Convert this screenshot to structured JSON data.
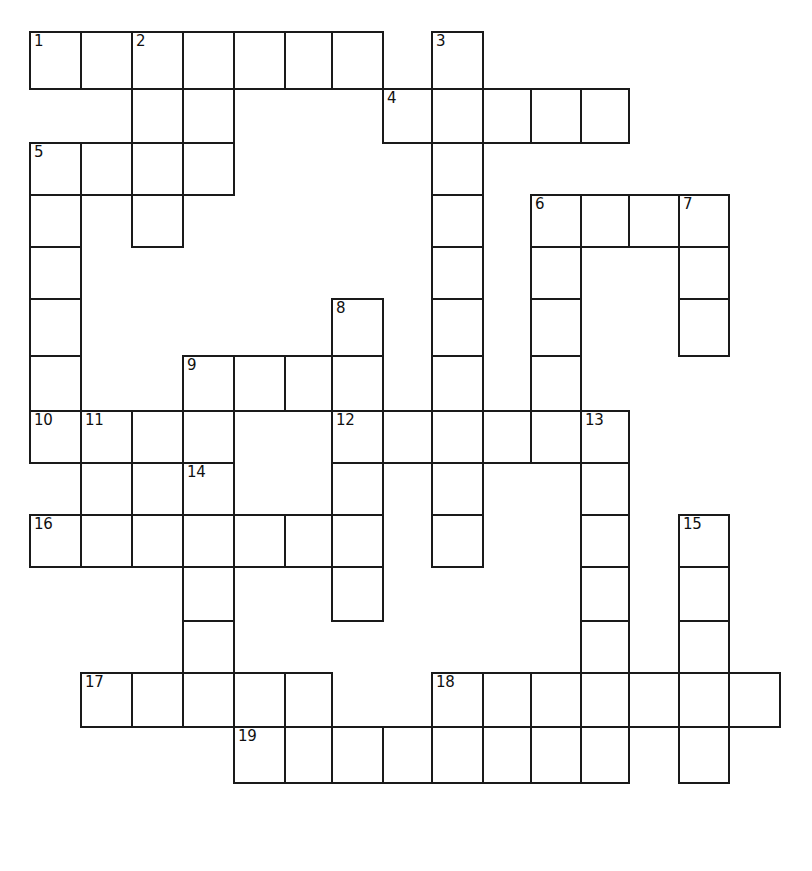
{
  "puzzle": {
    "kind": "crossword-grid",
    "title": "Crossword Puzzle Grid",
    "background_color": "#ffffff",
    "line_color": "#1a1a1a",
    "cell_size": 51,
    "grid_origin": {
      "x": 29,
      "y": 31
    },
    "column_x": [
      29,
      80,
      131,
      182,
      233,
      284,
      331,
      382,
      431,
      482,
      530,
      580,
      628,
      678,
      728
    ],
    "row_y": [
      31,
      88,
      142,
      194,
      246,
      298,
      355,
      410,
      462,
      514,
      566,
      620,
      672,
      726,
      782
    ],
    "numbers_visible": [
      "1",
      "2",
      "3",
      "4",
      "5",
      "6",
      "7",
      "8",
      "9",
      "10",
      "11",
      "12",
      "13",
      "14",
      "15",
      "16",
      "17",
      "18",
      "19"
    ],
    "entries": [
      {
        "number": "1",
        "direction": "across",
        "length": 7,
        "col": 0,
        "row": 0
      },
      {
        "number": "2",
        "direction": "down",
        "length": 4,
        "col": 2,
        "row": 0
      },
      {
        "number": "3",
        "direction": "down",
        "length": 10,
        "col": 8,
        "row": 0
      },
      {
        "number": "4",
        "direction": "across",
        "length": 5,
        "col": 7,
        "row": 1
      },
      {
        "number": "5",
        "direction": "across",
        "length": 4,
        "col": 0,
        "row": 2
      },
      {
        "number": "5",
        "direction": "down",
        "length": 6,
        "col": 0,
        "row": 2
      },
      {
        "number": "6",
        "direction": "across",
        "length": 4,
        "col": 10,
        "row": 3
      },
      {
        "number": "6",
        "direction": "down",
        "length": 5,
        "col": 10,
        "row": 3
      },
      {
        "number": "7",
        "direction": "down",
        "length": 3,
        "col": 13,
        "row": 3
      },
      {
        "number": "8",
        "direction": "down",
        "length": 6,
        "col": 6,
        "row": 5
      },
      {
        "number": "9",
        "direction": "across",
        "length": 4,
        "col": 3,
        "row": 6
      },
      {
        "number": "10",
        "direction": "across",
        "length": 2,
        "col": 0,
        "row": 7
      },
      {
        "number": "11",
        "direction": "down",
        "length": 3,
        "col": 1,
        "row": 7
      },
      {
        "number": "12",
        "direction": "across",
        "length": 6,
        "col": 6,
        "row": 7
      },
      {
        "number": "13",
        "direction": "down",
        "length": 7,
        "col": 11,
        "row": 7
      },
      {
        "number": "14",
        "direction": "down",
        "length": 5,
        "col": 3,
        "row": 8
      },
      {
        "number": "15",
        "direction": "down",
        "length": 6,
        "col": 13,
        "row": 9
      },
      {
        "number": "16",
        "direction": "across",
        "length": 6,
        "col": 0,
        "row": 9
      },
      {
        "number": "17",
        "direction": "across",
        "length": 5,
        "col": 1,
        "row": 12
      },
      {
        "number": "18",
        "direction": "across",
        "length": 7,
        "col": 8,
        "row": 12
      },
      {
        "number": "19",
        "direction": "across",
        "length": 8,
        "col": 4,
        "row": 13
      }
    ],
    "cells": [
      {
        "c": 0,
        "r": 0,
        "n": "1"
      },
      {
        "c": 1,
        "r": 0,
        "n": ""
      },
      {
        "c": 2,
        "r": 0,
        "n": "2"
      },
      {
        "c": 3,
        "r": 0,
        "n": ""
      },
      {
        "c": 4,
        "r": 0,
        "n": ""
      },
      {
        "c": 5,
        "r": 0,
        "n": ""
      },
      {
        "c": 6,
        "r": 0,
        "n": ""
      },
      {
        "c": 8,
        "r": 0,
        "n": "3"
      },
      {
        "c": 2,
        "r": 1,
        "n": ""
      },
      {
        "c": 3,
        "r": 1,
        "n": ""
      },
      {
        "c": 7,
        "r": 1,
        "n": "4"
      },
      {
        "c": 8,
        "r": 1,
        "n": ""
      },
      {
        "c": 9,
        "r": 1,
        "n": ""
      },
      {
        "c": 10,
        "r": 1,
        "n": ""
      },
      {
        "c": 11,
        "r": 1,
        "n": ""
      },
      {
        "c": 0,
        "r": 2,
        "n": "5"
      },
      {
        "c": 1,
        "r": 2,
        "n": ""
      },
      {
        "c": 2,
        "r": 2,
        "n": ""
      },
      {
        "c": 3,
        "r": 2,
        "n": ""
      },
      {
        "c": 8,
        "r": 2,
        "n": ""
      },
      {
        "c": 0,
        "r": 3,
        "n": ""
      },
      {
        "c": 2,
        "r": 3,
        "n": ""
      },
      {
        "c": 8,
        "r": 3,
        "n": ""
      },
      {
        "c": 10,
        "r": 3,
        "n": "6"
      },
      {
        "c": 11,
        "r": 3,
        "n": ""
      },
      {
        "c": 12,
        "r": 3,
        "n": ""
      },
      {
        "c": 13,
        "r": 3,
        "n": "7"
      },
      {
        "c": 0,
        "r": 4,
        "n": ""
      },
      {
        "c": 8,
        "r": 4,
        "n": ""
      },
      {
        "c": 10,
        "r": 4,
        "n": ""
      },
      {
        "c": 13,
        "r": 4,
        "n": ""
      },
      {
        "c": 0,
        "r": 5,
        "n": ""
      },
      {
        "c": 6,
        "r": 5,
        "n": "8"
      },
      {
        "c": 8,
        "r": 5,
        "n": ""
      },
      {
        "c": 10,
        "r": 5,
        "n": ""
      },
      {
        "c": 13,
        "r": 5,
        "n": ""
      },
      {
        "c": 0,
        "r": 6,
        "n": ""
      },
      {
        "c": 3,
        "r": 6,
        "n": "9"
      },
      {
        "c": 4,
        "r": 6,
        "n": ""
      },
      {
        "c": 5,
        "r": 6,
        "n": ""
      },
      {
        "c": 6,
        "r": 6,
        "n": ""
      },
      {
        "c": 8,
        "r": 6,
        "n": ""
      },
      {
        "c": 10,
        "r": 6,
        "n": ""
      },
      {
        "c": 0,
        "r": 7,
        "n": "10"
      },
      {
        "c": 1,
        "r": 7,
        "n": "11"
      },
      {
        "c": 2,
        "r": 7,
        "n": ""
      },
      {
        "c": 3,
        "r": 7,
        "n": ""
      },
      {
        "c": 6,
        "r": 7,
        "n": "12"
      },
      {
        "c": 7,
        "r": 7,
        "n": ""
      },
      {
        "c": 8,
        "r": 7,
        "n": ""
      },
      {
        "c": 9,
        "r": 7,
        "n": ""
      },
      {
        "c": 10,
        "r": 7,
        "n": ""
      },
      {
        "c": 11,
        "r": 7,
        "n": "13"
      },
      {
        "c": 1,
        "r": 8,
        "n": ""
      },
      {
        "c": 2,
        "r": 8,
        "n": ""
      },
      {
        "c": 3,
        "r": 8,
        "n": "14"
      },
      {
        "c": 6,
        "r": 8,
        "n": ""
      },
      {
        "c": 8,
        "r": 8,
        "n": ""
      },
      {
        "c": 11,
        "r": 8,
        "n": ""
      },
      {
        "c": 0,
        "r": 9,
        "n": "16"
      },
      {
        "c": 1,
        "r": 9,
        "n": ""
      },
      {
        "c": 2,
        "r": 9,
        "n": ""
      },
      {
        "c": 3,
        "r": 9,
        "n": ""
      },
      {
        "c": 4,
        "r": 9,
        "n": ""
      },
      {
        "c": 5,
        "r": 9,
        "n": ""
      },
      {
        "c": 6,
        "r": 9,
        "n": ""
      },
      {
        "c": 8,
        "r": 9,
        "n": ""
      },
      {
        "c": 11,
        "r": 9,
        "n": ""
      },
      {
        "c": 13,
        "r": 9,
        "n": "15"
      },
      {
        "c": 3,
        "r": 10,
        "n": ""
      },
      {
        "c": 6,
        "r": 10,
        "n": ""
      },
      {
        "c": 11,
        "r": 10,
        "n": ""
      },
      {
        "c": 13,
        "r": 10,
        "n": ""
      },
      {
        "c": 3,
        "r": 11,
        "n": ""
      },
      {
        "c": 11,
        "r": 11,
        "n": ""
      },
      {
        "c": 13,
        "r": 11,
        "n": ""
      },
      {
        "c": 1,
        "r": 12,
        "n": "17"
      },
      {
        "c": 2,
        "r": 12,
        "n": ""
      },
      {
        "c": 3,
        "r": 12,
        "n": ""
      },
      {
        "c": 4,
        "r": 12,
        "n": ""
      },
      {
        "c": 5,
        "r": 12,
        "n": ""
      },
      {
        "c": 8,
        "r": 12,
        "n": "18"
      },
      {
        "c": 9,
        "r": 12,
        "n": ""
      },
      {
        "c": 10,
        "r": 12,
        "n": ""
      },
      {
        "c": 11,
        "r": 12,
        "n": ""
      },
      {
        "c": 12,
        "r": 12,
        "n": ""
      },
      {
        "c": 13,
        "r": 12,
        "n": ""
      },
      {
        "c": 14,
        "r": 12,
        "n": ""
      },
      {
        "c": 13,
        "r": 13,
        "n": ""
      },
      {
        "c": 4,
        "r": 13,
        "n": "19"
      },
      {
        "c": 5,
        "r": 13,
        "n": ""
      },
      {
        "c": 6,
        "r": 13,
        "n": ""
      },
      {
        "c": 7,
        "r": 13,
        "n": ""
      },
      {
        "c": 8,
        "r": 13,
        "n": ""
      },
      {
        "c": 9,
        "r": 13,
        "n": ""
      },
      {
        "c": 10,
        "r": 13,
        "n": ""
      },
      {
        "c": 11,
        "r": 13,
        "n": ""
      }
    ]
  }
}
